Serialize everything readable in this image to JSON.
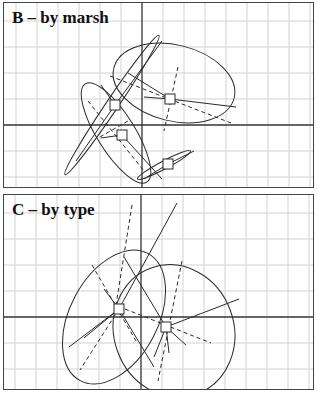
{
  "panels": [
    {
      "id": "B",
      "title": "B – by marsh",
      "top": 2,
      "height": 186,
      "axis_x": 138,
      "axis_y": 122,
      "grid_dx": 21,
      "grid_dy": 26,
      "centroids": [
        {
          "x": 111,
          "y": 102,
          "label": ""
        },
        {
          "x": 166,
          "y": 96,
          "label": ""
        },
        {
          "x": 118,
          "y": 132,
          "label": ""
        },
        {
          "x": 164,
          "y": 161,
          "label": ""
        }
      ]
    },
    {
      "id": "C",
      "title": "C – by type",
      "top": 194,
      "height": 196,
      "axis_x": 137,
      "axis_y": 122,
      "grid_dx": 21,
      "grid_dy": 26,
      "centroids": [
        {
          "x": 115,
          "y": 114,
          "label": ""
        },
        {
          "x": 162,
          "y": 132,
          "label": ""
        }
      ]
    }
  ],
  "colors": {
    "frame": "#444444",
    "grid": "#cfcfcf",
    "axis": "#333333",
    "ink": "#2a2a2a"
  }
}
